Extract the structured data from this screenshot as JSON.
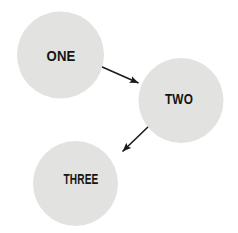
{
  "figure": {
    "background": "#ffffff",
    "nodes": [
      {
        "label": "ONE"
      },
      {
        "label": "TWO"
      },
      {
        "label": "THREE"
      }
    ],
    "edges": [
      {
        "from": "ONE",
        "to": "TWO"
      },
      {
        "from": "TWO",
        "to": "THREE"
      }
    ],
    "colors": {
      "node_fill": "#e2e2e0",
      "label_text": "#151515",
      "arrow": "#1b1b1b"
    }
  }
}
